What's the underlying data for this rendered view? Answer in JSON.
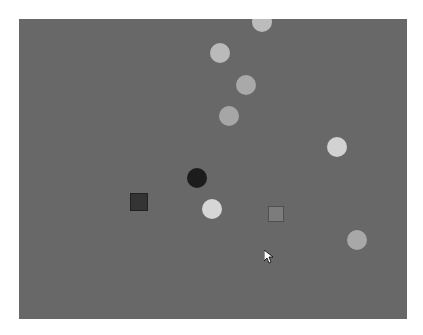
{
  "canvas": {
    "background": "#686868",
    "origin": [
      19,
      19
    ],
    "size": [
      388,
      300
    ]
  },
  "shapes": [
    {
      "type": "circle",
      "cx": 262,
      "cy": 22,
      "r": 10,
      "color": "#bcbcbc"
    },
    {
      "type": "circle",
      "cx": 220,
      "cy": 53,
      "r": 10,
      "color": "#bababa"
    },
    {
      "type": "circle",
      "cx": 246,
      "cy": 85,
      "r": 10,
      "color": "#a9a9a9"
    },
    {
      "type": "circle",
      "cx": 229,
      "cy": 116,
      "r": 10,
      "color": "#a6a6a6"
    },
    {
      "type": "circle",
      "cx": 337,
      "cy": 147,
      "r": 10,
      "color": "#d2d2d2"
    },
    {
      "type": "circle",
      "cx": 197,
      "cy": 178,
      "r": 10,
      "color": "#1c1c1c"
    },
    {
      "type": "square",
      "cx": 139,
      "cy": 202,
      "size": 18,
      "color": "#343434"
    },
    {
      "type": "circle",
      "cx": 212,
      "cy": 209,
      "r": 10,
      "color": "#d6d6d6"
    },
    {
      "type": "square",
      "cx": 276,
      "cy": 214,
      "size": 16,
      "color": "#7c7c7c"
    },
    {
      "type": "circle",
      "cx": 357,
      "cy": 240,
      "r": 10,
      "color": "#a8a8a8"
    }
  ],
  "cursor": {
    "x": 264,
    "y": 249,
    "icon": "arrow-cursor-icon"
  }
}
